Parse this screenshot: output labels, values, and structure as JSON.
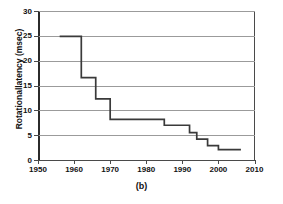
{
  "caption": "(b)",
  "axes": {
    "y_title": "Rotationallatency (msec)",
    "y_ticks": [
      "0",
      "5",
      "10",
      "15",
      "20",
      "25",
      "30"
    ],
    "x_ticks": [
      "1950",
      "1960",
      "1970",
      "1980",
      "1990",
      "2000",
      "2010"
    ]
  },
  "style": {
    "line_color": "#3a3a3a",
    "grid_color": "#9b9b9b",
    "axis_color": "#4a4a4a",
    "text_color": "#111111",
    "background": "#ffffff"
  },
  "chart_data": {
    "type": "line",
    "subtype": "step-post",
    "title": "",
    "xlabel": "",
    "ylabel": "Rotationallatency (msec)",
    "xlim": [
      1950,
      2010
    ],
    "ylim": [
      0,
      30
    ],
    "xticks": [
      1950,
      1960,
      1970,
      1980,
      1990,
      2000,
      2010
    ],
    "yticks": [
      0,
      5,
      10,
      15,
      20,
      25,
      30
    ],
    "grid": "horizontal",
    "legend": "none",
    "annotations": [
      "(b)"
    ],
    "series": [
      {
        "name": "Rotational latency",
        "x": [
          1956,
          1962,
          1966,
          1970,
          1985,
          1992,
          1994,
          1997,
          2000,
          2006
        ],
        "y": [
          25.0,
          16.7,
          12.4,
          8.3,
          7.1,
          5.6,
          4.3,
          3.0,
          2.2,
          2.0
        ]
      }
    ],
    "points": [
      {
        "year": 1956,
        "value": 25.0
      },
      {
        "year": 1962,
        "value": 16.7
      },
      {
        "year": 1966,
        "value": 12.4
      },
      {
        "year": 1970,
        "value": 8.3
      },
      {
        "year": 1985,
        "value": 7.1
      },
      {
        "year": 1992,
        "value": 5.6
      },
      {
        "year": 1994,
        "value": 4.3
      },
      {
        "year": 1997,
        "value": 3.0
      },
      {
        "year": 2000,
        "value": 2.2
      },
      {
        "year": 2006,
        "value": 2.0
      }
    ]
  }
}
